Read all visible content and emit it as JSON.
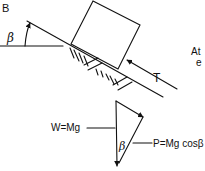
{
  "figure": {
    "panel_label": "B",
    "incline_angle_label": "β",
    "force_label_T": "T",
    "cropped_text": "At e",
    "triangle": {
      "weight_label": "W=Mg",
      "angle_label": "β",
      "normal_label": "P=Mg cosβ"
    }
  }
}
